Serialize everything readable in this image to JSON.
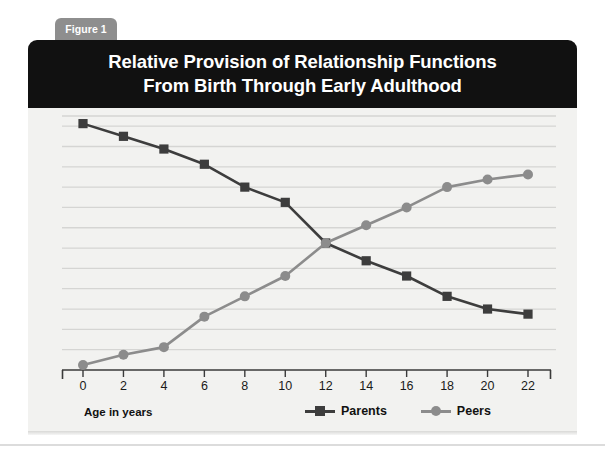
{
  "figure": {
    "tab_label": "Figure 1",
    "title_line1": "Relative Provision of Relationship Functions",
    "title_line2": "From Birth Through Early Adulthood"
  },
  "colors": {
    "title_bar_bg": "#111111",
    "tab_bg": "#8e8e8e",
    "card_bg": "#f2f2f0",
    "gridline": "#d5d5d3",
    "axis": "#3a3a3a",
    "parents": "#3d3d3d",
    "peers": "#8c8c8c"
  },
  "chart_data": {
    "type": "line",
    "title": "Relative Provision of Relationship Functions From Birth Through Early Adulthood",
    "xlabel": "Age in years",
    "ylabel": "Percent across relationship functions",
    "x": [
      0,
      2,
      4,
      6,
      8,
      10,
      12,
      14,
      16,
      18,
      20,
      22
    ],
    "xtick_labels": [
      "0",
      "2",
      "4",
      "6",
      "8",
      "10",
      "12",
      "14",
      "16",
      "18",
      "20",
      "22"
    ],
    "xlim": [
      0,
      22
    ],
    "ylim": [
      0,
      100
    ],
    "ytick_labels": [],
    "grid": true,
    "gridlines_y": [
      8,
      16,
      24,
      32,
      40,
      48,
      56,
      64,
      72,
      80,
      88,
      96,
      100
    ],
    "legend_position": "bottom-right",
    "series": [
      {
        "name": "Parents",
        "marker": "square",
        "color": "#3d3d3d",
        "values": [
          97,
          92,
          87,
          81,
          72,
          66,
          50,
          43,
          37,
          29,
          24,
          22
        ]
      },
      {
        "name": "Peers",
        "marker": "circle",
        "color": "#8c8c8c",
        "values": [
          2,
          6,
          9,
          21,
          29,
          37,
          50,
          57,
          64,
          72,
          75,
          77
        ]
      }
    ]
  },
  "legend": {
    "entries": [
      {
        "label": "Parents",
        "marker": "square",
        "color": "#3d3d3d"
      },
      {
        "label": "Peers",
        "marker": "circle",
        "color": "#8c8c8c"
      }
    ]
  }
}
